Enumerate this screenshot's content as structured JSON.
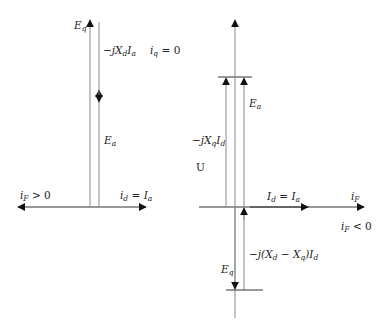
{
  "diagram": {
    "left_panel": {
      "labels": {
        "eq": {
          "main": "E",
          "sub": "q"
        },
        "jxd_ia": {
          "prefix": "−jX",
          "sub1": "d",
          "mid": "I",
          "sub2": "a"
        },
        "iq_zero": {
          "main": "i",
          "sub": "q",
          "rest": " = 0"
        },
        "ea": {
          "main": "E",
          "sub": "a"
        },
        "if_pos": {
          "main": "i",
          "sub": "F",
          "rest": " > 0"
        },
        "id_ia": {
          "main": "i",
          "sub": "d",
          "mid": " = I",
          "sub2": "a"
        }
      }
    },
    "right_panel": {
      "labels": {
        "ea": {
          "main": "E",
          "sub": "a"
        },
        "jxq_id": {
          "prefix": "−jX",
          "sub1": "q",
          "mid": "I",
          "sub2": "d"
        },
        "u": "U",
        "id_ia": {
          "main": "I",
          "sub": "d",
          "mid": " = I",
          "sub2": "a"
        },
        "if": {
          "main": "i",
          "sub": "F"
        },
        "if_neg": {
          "main": "i",
          "sub": "F",
          "rest": " < 0"
        },
        "jxdxq_id": {
          "prefix": "−j(X",
          "sub1": "d",
          "mid": " − X",
          "sub2": "q",
          "end": ")I",
          "sub3": "d"
        },
        "eq": {
          "main": "E",
          "sub": "q"
        }
      }
    },
    "colors": {
      "line": "#8a8a8a",
      "axis": "#333333",
      "arrow": "#111111"
    }
  }
}
